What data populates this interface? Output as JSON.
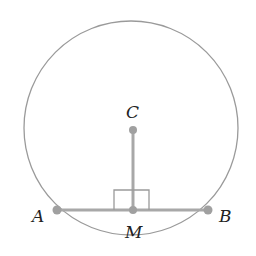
{
  "diagram": {
    "labels": {
      "center": "C",
      "chord_left": "A",
      "chord_right": "B",
      "midpoint": "M"
    },
    "colors": {
      "circle": "#9a9a9a",
      "segment": "#a8a8a8",
      "text": "#222222"
    }
  }
}
